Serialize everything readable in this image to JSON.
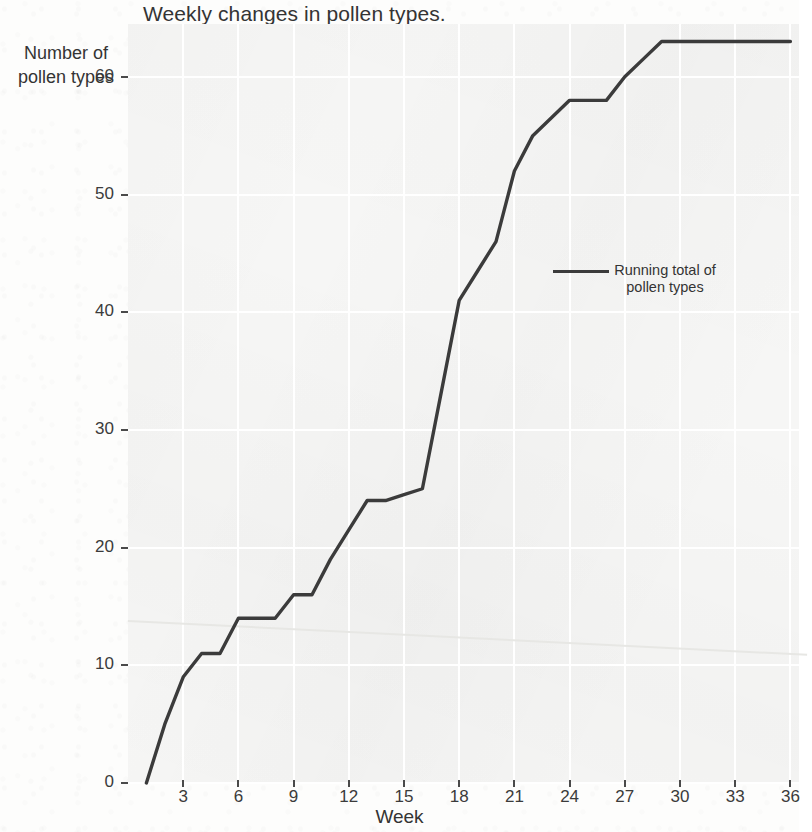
{
  "chart_data": {
    "type": "line",
    "title": "Weekly changes in pollen types.",
    "xlabel": "Week",
    "ylabel": "Number of pollen types",
    "ylabel_lines": [
      "Number of",
      "pollen types"
    ],
    "xlim": [
      0,
      36
    ],
    "ylim": [
      0,
      63.5
    ],
    "xticks": [
      3,
      6,
      9,
      12,
      15,
      18,
      21,
      24,
      27,
      30,
      33,
      36
    ],
    "yticks": [
      0,
      10,
      20,
      30,
      40,
      50,
      60
    ],
    "grid": true,
    "grid_color": "#ffffff",
    "plot_bg": "#f6f6f5",
    "line_color": "#3b3b3b",
    "line_width": 3.4,
    "legend_position": "center-right",
    "series": [
      {
        "name": "Running total of pollen types",
        "name_lines": [
          "Running total of",
          "pollen types"
        ],
        "x": [
          1,
          2,
          3,
          4,
          5,
          6,
          7,
          8,
          9,
          10,
          11,
          12,
          13,
          14,
          15,
          16,
          17,
          18,
          19,
          20,
          21,
          22,
          23,
          24,
          25,
          26,
          27,
          28,
          29,
          30,
          31,
          32,
          33,
          34,
          35,
          36
        ],
        "values": [
          0,
          5,
          9,
          11,
          11,
          14,
          14,
          14,
          16,
          16,
          19,
          21.5,
          24,
          24,
          24.5,
          25,
          33,
          41,
          43.5,
          46,
          52,
          55,
          56.5,
          58,
          58,
          58,
          60,
          61.5,
          63,
          63,
          63,
          63,
          63,
          63,
          63,
          63
        ]
      }
    ]
  },
  "geometry": {
    "plot_left": 128,
    "plot_top": 24,
    "plot_width": 671,
    "plot_height": 759,
    "x_week0_px": 0,
    "px_per_week": 18.4,
    "y_zero_px": 759,
    "px_per_unit": 11.77
  }
}
